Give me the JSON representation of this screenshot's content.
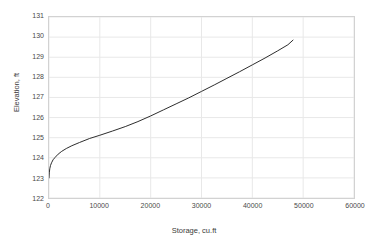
{
  "chart_data": {
    "type": "line",
    "title": "",
    "xlabel": "Storage, cu.ft",
    "ylabel": "Elevation, ft",
    "xlim": [
      0,
      60000
    ],
    "ylim": [
      122,
      131
    ],
    "xticks": [
      0,
      10000,
      20000,
      30000,
      40000,
      50000,
      60000
    ],
    "xtick_labels": [
      "0",
      "10000",
      "20000",
      "30000",
      "40000",
      "50000",
      "60000"
    ],
    "yticks": [
      122,
      123,
      124,
      125,
      126,
      127,
      128,
      129,
      130,
      131
    ],
    "ytick_labels": [
      "122",
      "123",
      "124",
      "125",
      "126",
      "127",
      "128",
      "129",
      "130",
      "131"
    ],
    "grid": true,
    "legend": null,
    "series": [
      {
        "name": "Elevation-Storage",
        "color": "#2b2b2b",
        "line_width": 1,
        "x": [
          0,
          60,
          150,
          300,
          500,
          800,
          1200,
          1800,
          2500,
          3400,
          4500,
          6000,
          8000,
          10000,
          12500,
          15000,
          17500,
          20000,
          22500,
          25000,
          27500,
          30000,
          32500,
          35000,
          37500,
          40000,
          42500,
          45000,
          47000,
          48000
        ],
        "y": [
          123.0,
          123.25,
          123.45,
          123.62,
          123.75,
          123.9,
          124.02,
          124.18,
          124.32,
          124.46,
          124.6,
          124.76,
          124.96,
          125.12,
          125.33,
          125.55,
          125.8,
          126.08,
          126.38,
          126.68,
          126.98,
          127.3,
          127.62,
          127.95,
          128.28,
          128.62,
          128.96,
          129.32,
          129.62,
          129.85
        ]
      }
    ]
  },
  "axis": {
    "x_title": "Storage, cu.ft",
    "y_title": "Elevation, ft"
  },
  "style": {
    "grid_color": "#e8e8e8",
    "border_color": "#d2d2d2",
    "curve_color": "#2b2b2b",
    "text_color": "#4a4a4a",
    "background": "#ffffff"
  }
}
